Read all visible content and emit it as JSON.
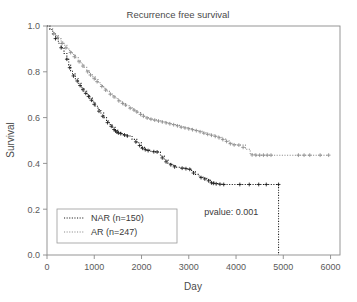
{
  "chart_data": {
    "type": "line",
    "title": "Recurrence free survival",
    "xlabel": "Day",
    "ylabel": "Survival",
    "xlim": [
      0,
      6200
    ],
    "ylim": [
      0.0,
      1.0
    ],
    "grid": false,
    "x_ticks": [
      0,
      1000,
      2000,
      3000,
      4000,
      5000,
      6000
    ],
    "x_tick_labels": [
      "0",
      "1000",
      "2000",
      "3000",
      "4000",
      "5000",
      "6000"
    ],
    "y_ticks": [
      0.0,
      0.2,
      0.4,
      0.6,
      0.8,
      1.0
    ],
    "y_tick_labels": [
      "0.0",
      "0.2",
      "0.4",
      "0.6",
      "0.8",
      "1.0"
    ],
    "legend_position": "lower-left",
    "annotations": [
      {
        "name": "pvalue",
        "text": "pvalue: 0.001",
        "x": 3900,
        "y": 0.175
      }
    ],
    "series": [
      {
        "name": "NAR",
        "label": "NAR (n=150)",
        "n": 150,
        "color": "#1a1a1a",
        "linestyle": "dotted",
        "points": [
          [
            0,
            1.0
          ],
          [
            60,
            0.985
          ],
          [
            120,
            0.965
          ],
          [
            180,
            0.945
          ],
          [
            240,
            0.925
          ],
          [
            300,
            0.905
          ],
          [
            360,
            0.88
          ],
          [
            420,
            0.855
          ],
          [
            460,
            0.83
          ],
          [
            500,
            0.805
          ],
          [
            540,
            0.79
          ],
          [
            600,
            0.77
          ],
          [
            660,
            0.75
          ],
          [
            720,
            0.73
          ],
          [
            780,
            0.715
          ],
          [
            840,
            0.7
          ],
          [
            900,
            0.685
          ],
          [
            960,
            0.668
          ],
          [
            1020,
            0.65
          ],
          [
            1080,
            0.635
          ],
          [
            1140,
            0.62
          ],
          [
            1200,
            0.6
          ],
          [
            1260,
            0.585
          ],
          [
            1320,
            0.57
          ],
          [
            1380,
            0.558
          ],
          [
            1440,
            0.545
          ],
          [
            1500,
            0.535
          ],
          [
            1560,
            0.53
          ],
          [
            1620,
            0.525
          ],
          [
            1700,
            0.52
          ],
          [
            1800,
            0.505
          ],
          [
            1900,
            0.49
          ],
          [
            2000,
            0.47
          ],
          [
            2060,
            0.462
          ],
          [
            2120,
            0.458
          ],
          [
            2200,
            0.452
          ],
          [
            2300,
            0.45
          ],
          [
            2400,
            0.432
          ],
          [
            2480,
            0.415
          ],
          [
            2560,
            0.4
          ],
          [
            2640,
            0.392
          ],
          [
            2720,
            0.383
          ],
          [
            2800,
            0.38
          ],
          [
            2900,
            0.378
          ],
          [
            2980,
            0.376
          ],
          [
            3060,
            0.365
          ],
          [
            3140,
            0.352
          ],
          [
            3220,
            0.34
          ],
          [
            3300,
            0.335
          ],
          [
            3380,
            0.33
          ],
          [
            3460,
            0.318
          ],
          [
            3540,
            0.312
          ],
          [
            3620,
            0.31
          ],
          [
            3700,
            0.308
          ],
          [
            3800,
            0.308
          ],
          [
            4000,
            0.308
          ],
          [
            4200,
            0.308
          ],
          [
            4400,
            0.308
          ],
          [
            4600,
            0.308
          ],
          [
            4800,
            0.308
          ],
          [
            4900,
            0.308
          ],
          [
            4900,
            0.0
          ]
        ],
        "censor_marks": [
          [
            180,
            0.945
          ],
          [
            300,
            0.905
          ],
          [
            420,
            0.855
          ],
          [
            480,
            0.818
          ],
          [
            560,
            0.782
          ],
          [
            640,
            0.76
          ],
          [
            700,
            0.74
          ],
          [
            760,
            0.722
          ],
          [
            820,
            0.706
          ],
          [
            880,
            0.692
          ],
          [
            940,
            0.676
          ],
          [
            1000,
            0.658
          ],
          [
            1100,
            0.628
          ],
          [
            1180,
            0.606
          ],
          [
            1280,
            0.578
          ],
          [
            1360,
            0.562
          ],
          [
            1420,
            0.548
          ],
          [
            1450,
            0.542
          ],
          [
            1480,
            0.537
          ],
          [
            1510,
            0.533
          ],
          [
            1560,
            0.53
          ],
          [
            1640,
            0.524
          ],
          [
            1700,
            0.52
          ],
          [
            1880,
            0.494
          ],
          [
            1960,
            0.478
          ],
          [
            2020,
            0.466
          ],
          [
            2080,
            0.46
          ],
          [
            2140,
            0.456
          ],
          [
            2260,
            0.451
          ],
          [
            2330,
            0.45
          ],
          [
            2440,
            0.424
          ],
          [
            2520,
            0.407
          ],
          [
            2620,
            0.394
          ],
          [
            2700,
            0.385
          ],
          [
            2860,
            0.379
          ],
          [
            2940,
            0.377
          ],
          [
            3020,
            0.374
          ],
          [
            3100,
            0.358
          ],
          [
            3260,
            0.338
          ],
          [
            3340,
            0.332
          ],
          [
            3420,
            0.324
          ],
          [
            3480,
            0.315
          ],
          [
            3520,
            0.313
          ],
          [
            3580,
            0.311
          ],
          [
            3660,
            0.309
          ],
          [
            3740,
            0.308
          ],
          [
            4080,
            0.308
          ],
          [
            4280,
            0.308
          ],
          [
            4480,
            0.308
          ],
          [
            4640,
            0.308
          ],
          [
            4900,
            0.308
          ]
        ]
      },
      {
        "name": "AR",
        "label": "AR  (n=247)",
        "n": 247,
        "color": "#8c8c8c",
        "linestyle": "dotted",
        "points": [
          [
            0,
            1.0
          ],
          [
            60,
            0.988
          ],
          [
            120,
            0.972
          ],
          [
            180,
            0.958
          ],
          [
            240,
            0.944
          ],
          [
            300,
            0.93
          ],
          [
            360,
            0.916
          ],
          [
            420,
            0.9
          ],
          [
            480,
            0.888
          ],
          [
            540,
            0.876
          ],
          [
            600,
            0.862
          ],
          [
            660,
            0.848
          ],
          [
            720,
            0.834
          ],
          [
            780,
            0.82
          ],
          [
            840,
            0.806
          ],
          [
            900,
            0.79
          ],
          [
            960,
            0.778
          ],
          [
            1020,
            0.766
          ],
          [
            1080,
            0.752
          ],
          [
            1140,
            0.74
          ],
          [
            1200,
            0.728
          ],
          [
            1260,
            0.716
          ],
          [
            1320,
            0.706
          ],
          [
            1380,
            0.696
          ],
          [
            1440,
            0.686
          ],
          [
            1500,
            0.676
          ],
          [
            1560,
            0.668
          ],
          [
            1620,
            0.66
          ],
          [
            1680,
            0.652
          ],
          [
            1740,
            0.644
          ],
          [
            1800,
            0.638
          ],
          [
            1860,
            0.63
          ],
          [
            1920,
            0.622
          ],
          [
            1980,
            0.614
          ],
          [
            2040,
            0.606
          ],
          [
            2100,
            0.6
          ],
          [
            2180,
            0.594
          ],
          [
            2260,
            0.59
          ],
          [
            2340,
            0.586
          ],
          [
            2420,
            0.582
          ],
          [
            2500,
            0.578
          ],
          [
            2580,
            0.574
          ],
          [
            2660,
            0.57
          ],
          [
            2740,
            0.566
          ],
          [
            2820,
            0.56
          ],
          [
            2900,
            0.556
          ],
          [
            2980,
            0.552
          ],
          [
            3060,
            0.548
          ],
          [
            3140,
            0.544
          ],
          [
            3220,
            0.54
          ],
          [
            3300,
            0.534
          ],
          [
            3380,
            0.528
          ],
          [
            3460,
            0.524
          ],
          [
            3540,
            0.52
          ],
          [
            3620,
            0.514
          ],
          [
            3700,
            0.506
          ],
          [
            3780,
            0.498
          ],
          [
            3860,
            0.488
          ],
          [
            3940,
            0.482
          ],
          [
            4020,
            0.48
          ],
          [
            4100,
            0.48
          ],
          [
            4200,
            0.462
          ],
          [
            4300,
            0.44
          ],
          [
            4400,
            0.436
          ],
          [
            4600,
            0.436
          ],
          [
            4800,
            0.436
          ],
          [
            5000,
            0.436
          ],
          [
            5200,
            0.436
          ],
          [
            5400,
            0.436
          ],
          [
            5600,
            0.436
          ],
          [
            5800,
            0.436
          ],
          [
            5960,
            0.436
          ]
        ],
        "censor_marks": [
          [
            140,
            0.966
          ],
          [
            220,
            0.95
          ],
          [
            320,
            0.924
          ],
          [
            400,
            0.905
          ],
          [
            500,
            0.884
          ],
          [
            580,
            0.866
          ],
          [
            680,
            0.844
          ],
          [
            760,
            0.825
          ],
          [
            860,
            0.8
          ],
          [
            920,
            0.786
          ],
          [
            1000,
            0.77
          ],
          [
            1060,
            0.757
          ],
          [
            1160,
            0.736
          ],
          [
            1240,
            0.72
          ],
          [
            1340,
            0.702
          ],
          [
            1420,
            0.69
          ],
          [
            1520,
            0.673
          ],
          [
            1600,
            0.662
          ],
          [
            1660,
            0.655
          ],
          [
            1760,
            0.641
          ],
          [
            1840,
            0.633
          ],
          [
            1900,
            0.625
          ],
          [
            1980,
            0.614
          ],
          [
            2040,
            0.606
          ],
          [
            2120,
            0.598
          ],
          [
            2200,
            0.593
          ],
          [
            2280,
            0.589
          ],
          [
            2360,
            0.585
          ],
          [
            2440,
            0.581
          ],
          [
            2520,
            0.577
          ],
          [
            2600,
            0.573
          ],
          [
            2680,
            0.569
          ],
          [
            2760,
            0.564
          ],
          [
            2840,
            0.558
          ],
          [
            2920,
            0.555
          ],
          [
            3000,
            0.551
          ],
          [
            3080,
            0.547
          ],
          [
            3160,
            0.543
          ],
          [
            3240,
            0.538
          ],
          [
            3320,
            0.532
          ],
          [
            3400,
            0.527
          ],
          [
            3480,
            0.523
          ],
          [
            3560,
            0.518
          ],
          [
            3640,
            0.512
          ],
          [
            3720,
            0.504
          ],
          [
            3800,
            0.496
          ],
          [
            3880,
            0.486
          ],
          [
            3960,
            0.481
          ],
          [
            4060,
            0.48
          ],
          [
            4150,
            0.47
          ],
          [
            4340,
            0.437
          ],
          [
            4420,
            0.436
          ],
          [
            4500,
            0.436
          ],
          [
            4580,
            0.436
          ],
          [
            4660,
            0.436
          ],
          [
            4740,
            0.436
          ],
          [
            5320,
            0.436
          ],
          [
            5440,
            0.436
          ],
          [
            5560,
            0.436
          ],
          [
            5780,
            0.436
          ],
          [
            5960,
            0.436
          ]
        ]
      }
    ]
  },
  "axis": {
    "color": "#8a8a8a"
  },
  "legend": {
    "entries": [
      {
        "label": "NAR (n=150)",
        "color": "#1a1a1a"
      },
      {
        "label": "AR  (n=247)",
        "color": "#8c8c8c"
      }
    ]
  }
}
